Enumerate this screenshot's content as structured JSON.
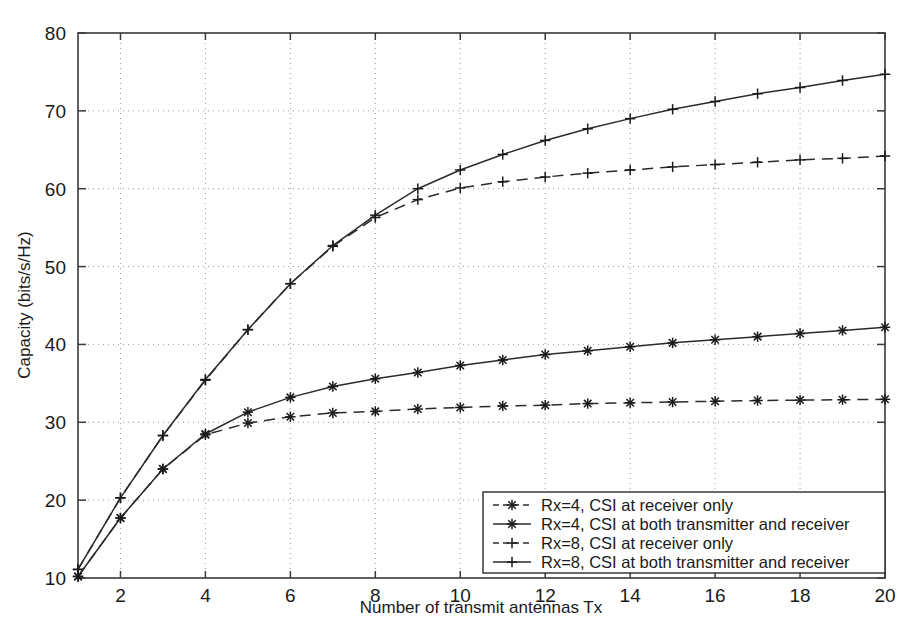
{
  "chart_data": {
    "type": "line",
    "title": "",
    "xlabel": "Number of transmit antennas Tx",
    "ylabel": "Capacity (bits/s/Hz)",
    "xlim": [
      1,
      20
    ],
    "ylim": [
      10,
      80
    ],
    "grid": true,
    "legend_position": "lower right",
    "x_ticks": [
      2,
      4,
      6,
      8,
      10,
      12,
      14,
      16,
      18,
      20
    ],
    "y_ticks": [
      10,
      20,
      30,
      40,
      50,
      60,
      70,
      80
    ],
    "x": [
      1,
      2,
      3,
      4,
      5,
      6,
      7,
      8,
      9,
      10,
      11,
      12,
      13,
      14,
      15,
      16,
      17,
      18,
      19,
      20
    ],
    "series": [
      {
        "name": "Rx=4, CSI at receiver only",
        "marker": "asterisk",
        "linestyle": "dashed",
        "values": [
          10.2,
          17.7,
          24.0,
          28.4,
          29.9,
          30.7,
          31.2,
          31.4,
          31.7,
          31.9,
          32.1,
          32.2,
          32.4,
          32.5,
          32.6,
          32.7,
          32.8,
          32.85,
          32.9,
          32.95
        ]
      },
      {
        "name": "Rx=4, CSI at both transmitter and receiver",
        "marker": "asterisk",
        "linestyle": "solid",
        "values": [
          10.2,
          17.7,
          24.0,
          28.5,
          31.3,
          33.2,
          34.6,
          35.6,
          36.4,
          37.3,
          38.0,
          38.7,
          39.2,
          39.7,
          40.2,
          40.6,
          41.0,
          41.4,
          41.8,
          42.2
        ]
      },
      {
        "name": "Rx=8, CSI at receiver only",
        "marker": "plus",
        "linestyle": "dashed",
        "values": [
          11.1,
          20.3,
          28.3,
          35.4,
          41.9,
          47.8,
          52.6,
          56.3,
          58.6,
          60.1,
          60.9,
          61.5,
          62.0,
          62.4,
          62.8,
          63.1,
          63.4,
          63.7,
          63.9,
          64.2
        ]
      },
      {
        "name": "Rx=8, CSI at both transmitter and receiver",
        "marker": "plus",
        "linestyle": "solid",
        "values": [
          11.1,
          20.3,
          28.3,
          35.5,
          41.9,
          47.8,
          52.7,
          56.6,
          60.0,
          62.4,
          64.4,
          66.2,
          67.7,
          69.0,
          70.2,
          71.2,
          72.2,
          73.0,
          73.9,
          74.7
        ]
      }
    ],
    "legend_entries": [
      {
        "label": "Rx=4, CSI at receiver only",
        "marker": "asterisk",
        "linestyle": "dashed"
      },
      {
        "label": "Rx=4, CSI at both transmitter and receiver",
        "marker": "asterisk",
        "linestyle": "solid"
      },
      {
        "label": "Rx=8, CSI at receiver only",
        "marker": "plus",
        "linestyle": "dashed"
      },
      {
        "label": "Rx=8, CSI at both transmitter and receiver",
        "marker": "plus",
        "linestyle": "solid"
      }
    ],
    "colors": {
      "line": "#2b2b2b",
      "axis": "#3a3a3a",
      "grid": "#9a9a9a",
      "background": "#ffffff",
      "text": "#1a1a1a"
    }
  }
}
